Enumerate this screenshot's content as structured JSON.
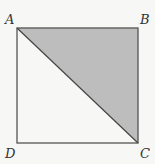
{
  "figure": {
    "type": "square-with-diagonal",
    "vertices": {
      "A": {
        "label": "A",
        "x": 17,
        "y": 28
      },
      "B": {
        "label": "B",
        "x": 138,
        "y": 28
      },
      "C": {
        "label": "C",
        "x": 138,
        "y": 143
      },
      "D": {
        "label": "D",
        "x": 17,
        "y": 143
      }
    },
    "diagonal": [
      "A",
      "C"
    ],
    "shaded_region": [
      "A",
      "B",
      "C"
    ],
    "colors": {
      "background": "#f7f7f5",
      "stroke": "#555555",
      "shade": "#bdbdbd",
      "label": "#333333"
    }
  }
}
